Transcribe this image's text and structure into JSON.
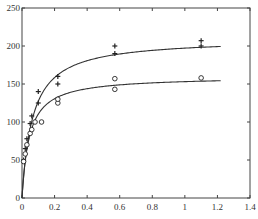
{
  "chart_data": {
    "type": "scatter",
    "title": "",
    "xlabel": "",
    "ylabel": "",
    "xlim": [
      0,
      1.4
    ],
    "ylim": [
      0,
      250
    ],
    "grid": false,
    "legend": null,
    "x_ticks": [
      "0",
      "0.2",
      "0.4",
      "0.6",
      "0.8",
      "1",
      "1.2",
      "1.4"
    ],
    "y_ticks": [
      "0",
      "50",
      "100",
      "150",
      "200",
      "250"
    ],
    "series": [
      {
        "name": "plus",
        "marker": "+",
        "points": [
          [
            0.01,
            50
          ],
          [
            0.02,
            65
          ],
          [
            0.03,
            78
          ],
          [
            0.05,
            98
          ],
          [
            0.06,
            108
          ],
          [
            0.1,
            125
          ],
          [
            0.1,
            140
          ],
          [
            0.22,
            150
          ],
          [
            0.22,
            160
          ],
          [
            0.57,
            190
          ],
          [
            0.57,
            200
          ],
          [
            1.1,
            200
          ],
          [
            1.1,
            207
          ]
        ],
        "fit_curve": {
          "model": "Vmax*x/(Km+x)",
          "Vmax": 210,
          "Km": 0.065,
          "x_range": [
            0,
            1.22
          ]
        }
      },
      {
        "name": "circle",
        "marker": "o",
        "points": [
          [
            0.01,
            48
          ],
          [
            0.02,
            58
          ],
          [
            0.03,
            70
          ],
          [
            0.05,
            85
          ],
          [
            0.06,
            90
          ],
          [
            0.08,
            100
          ],
          [
            0.12,
            100
          ],
          [
            0.22,
            125
          ],
          [
            0.22,
            130
          ],
          [
            0.57,
            143
          ],
          [
            0.57,
            157
          ],
          [
            1.1,
            158
          ]
        ],
        "fit_curve": {
          "model": "Vmax*x/(Km+x)",
          "Vmax": 160,
          "Km": 0.045,
          "x_range": [
            0,
            1.22
          ]
        }
      }
    ]
  }
}
